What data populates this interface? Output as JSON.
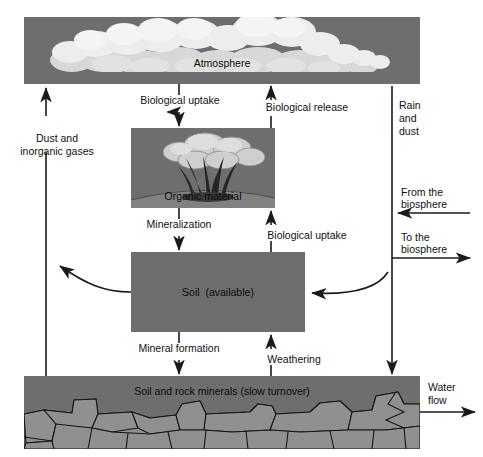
{
  "diagram": {
    "colors": {
      "box_fill": "#6e6e6e",
      "rock_fill": "#909090",
      "cloud_light": "#e8e8e8",
      "cloud_mid": "#cfcfcf",
      "tree_dark": "#2a2a2a",
      "line": "#1a1a1a",
      "background": "#ffffff"
    },
    "boxes": [
      {
        "id": "atmosphere",
        "label": "Atmosphere",
        "x": 24,
        "y": 17,
        "w": 396,
        "h": 67
      },
      {
        "id": "organic-material",
        "label": "Organic material",
        "x": 131,
        "y": 128,
        "w": 144,
        "h": 80
      },
      {
        "id": "soil",
        "label": "Soil  (available)",
        "x": 131,
        "y": 252,
        "w": 174,
        "h": 80
      },
      {
        "id": "soil-rock-minerals",
        "label": "Soil and rock minerals (slow turnover)",
        "x": 24,
        "y": 376,
        "w": 396,
        "h": 73
      }
    ],
    "flow_labels": [
      {
        "id": "biological-uptake-atmosphere",
        "text": "Biological uptake"
      },
      {
        "id": "biological-release",
        "text": "Biological release"
      },
      {
        "id": "dust-and-inorganic-gases",
        "text": "Dust and\ninorganic gases"
      },
      {
        "id": "rain-and-dust",
        "text": "Rain\nand\ndust"
      },
      {
        "id": "mineralization",
        "text": "Mineralization"
      },
      {
        "id": "biological-uptake-soil",
        "text": "Biological uptake"
      },
      {
        "id": "from-the-biosphere",
        "text": "From the\nbiosphere"
      },
      {
        "id": "to-the-biosphere",
        "text": "To the\nbiosphere"
      },
      {
        "id": "mineral-formation",
        "text": "Mineral formation"
      },
      {
        "id": "weathering",
        "text": "Weathering"
      },
      {
        "id": "water-flow",
        "text": "Water\nflow"
      }
    ],
    "labels": {
      "atmosphere": "Atmosphere",
      "organic_material": "Organic material",
      "soil": "Soil  (available)",
      "soil_rock_minerals": "Soil and rock minerals (slow turnover)",
      "biological_uptake_top": "Biological uptake",
      "biological_release": "Biological release",
      "dust_line1": "Dust and",
      "dust_line2": "inorganic gases",
      "rain_line1": "Rain",
      "rain_line2": "and",
      "rain_line3": "dust",
      "mineralization": "Mineralization",
      "biological_uptake_soil": "Biological uptake",
      "from_biosphere_line1": "From the",
      "from_biosphere_line2": "biosphere",
      "to_biosphere_line1": "To the",
      "to_biosphere_line2": "biosphere",
      "mineral_formation": "Mineral formation",
      "weathering": "Weathering",
      "water_flow_line1": "Water",
      "water_flow_line2": "flow"
    }
  }
}
